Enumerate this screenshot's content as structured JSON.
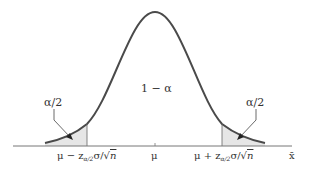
{
  "diagram": {
    "type": "normal-distribution-confidence-interval",
    "center_label": "1 − α",
    "left_tail_label": "α/2",
    "right_tail_label": "α/2",
    "axis_variable": "x̄",
    "ticks": [
      {
        "label_main": "μ − z",
        "label_sub": "α/2",
        "label_rest": "σ/",
        "label_root": "n",
        "position": "left-bound"
      },
      {
        "label_main": "μ",
        "position": "mean"
      },
      {
        "label_main": "μ + z",
        "label_sub": "α/2",
        "label_rest": "σ/",
        "label_root": "n",
        "position": "right-bound"
      }
    ],
    "colors": {
      "curve": "#4a4a4a",
      "shade": "#e6e6e6",
      "axis": "#777777",
      "text": "#333333"
    }
  }
}
